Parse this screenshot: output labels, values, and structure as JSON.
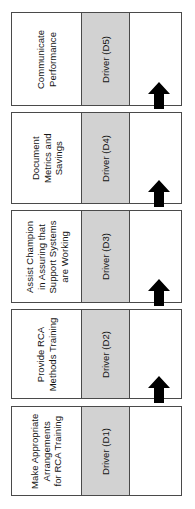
{
  "diagram": {
    "orientation": "vertical-stack-bottom-to-top",
    "colors": {
      "driver_fill": "#d2d2d2",
      "task_fill": "#ffffff",
      "border": "#4a4a4a",
      "arrow": "#000000",
      "text": "#141414"
    },
    "rows": [
      {
        "task": "Communicate\nPerformance",
        "driver": "Driver (D5)",
        "order": 5
      },
      {
        "task": "Document\nMetrics and\nSavings",
        "driver": "Driver (D4)",
        "order": 4
      },
      {
        "task": "Assist Champion\nin Assuring that\nSupport Systems\nare Working",
        "driver": "Driver (D3)",
        "order": 3
      },
      {
        "task": "Provide RCA\nMethods Training",
        "driver": "Driver (D2)",
        "order": 2
      },
      {
        "task": "Make Appropriate\nArrangements\nfor RCA Training",
        "driver": "Driver (D1)",
        "order": 1
      }
    ],
    "connectors": [
      {
        "name": "arrow-d4-to-d5",
        "direction": "up"
      },
      {
        "name": "arrow-d3-to-d4",
        "direction": "up"
      },
      {
        "name": "arrow-d2-to-d3",
        "direction": "up"
      },
      {
        "name": "arrow-d1-to-d2",
        "direction": "up"
      }
    ]
  }
}
